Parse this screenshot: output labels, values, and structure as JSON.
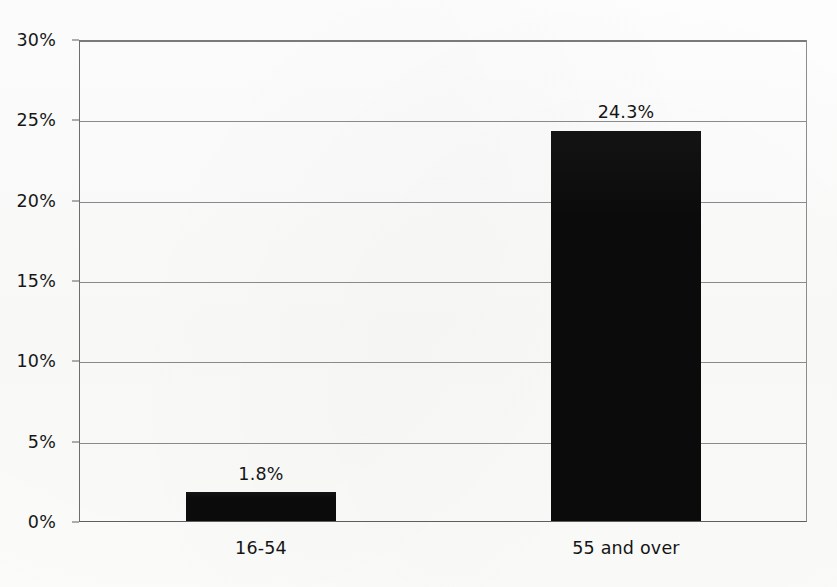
{
  "chart_data": {
    "type": "bar",
    "title": "",
    "subtitle": "",
    "xlabel": "",
    "ylabel": "",
    "categories": [
      "16-54",
      "55 and over"
    ],
    "values": [
      1.8,
      24.3
    ],
    "value_labels": [
      "1.8%",
      "24.3%"
    ],
    "ylim": [
      0,
      30
    ],
    "y_tick_labels": [
      "0%",
      "5%",
      "10%",
      "15%",
      "20%",
      "25%",
      "30%"
    ],
    "y_ticks": [
      0,
      5,
      10,
      15,
      20,
      25,
      30
    ],
    "grid": true,
    "legend": false,
    "legend_position": "none",
    "series": [
      {
        "name": "",
        "values": [
          1.8,
          24.3
        ],
        "color": "#0b0b0b"
      }
    ],
    "colors": {
      "bar": "#0b0b0b",
      "gridline": "#8a8a8a",
      "axis": "#5e5e5e",
      "text": "#151515",
      "background": "#fdfdfc"
    }
  }
}
